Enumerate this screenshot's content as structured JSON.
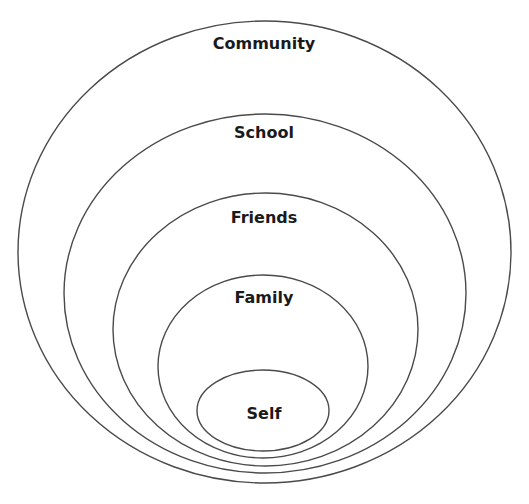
{
  "diagram": {
    "type": "nested-ellipses",
    "stroke_color": "#4a4a4a",
    "text_color": "#1a1a1a",
    "background": "#ffffff",
    "rings": [
      {
        "label": "Community",
        "cx": 264.5,
        "cy": 252,
        "rx": 246.5,
        "ry": 231,
        "label_y": 44
      },
      {
        "label": "School",
        "cx": 265,
        "cy": 293.5,
        "rx": 201,
        "ry": 179.5,
        "label_y": 133
      },
      {
        "label": "Friends",
        "cx": 265.5,
        "cy": 329.5,
        "rx": 152.5,
        "ry": 136.5,
        "label_y": 218
      },
      {
        "label": "Family",
        "cx": 263,
        "cy": 366.5,
        "rx": 105,
        "ry": 91.5,
        "label_y": 298
      },
      {
        "label": "Self",
        "cx": 263,
        "cy": 410.5,
        "rx": 66,
        "ry": 40.5,
        "label_y": 414
      }
    ]
  }
}
